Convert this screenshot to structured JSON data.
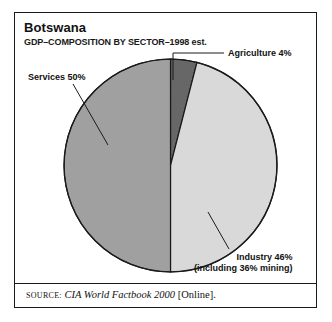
{
  "figure": {
    "title": "Botswana",
    "subtitle": "GDP–COMPOSITION BY SECTOR–1998 est.",
    "source_prefix": "SOURCE:",
    "source_italic": "CIA World Factbook 2000",
    "source_suffix": "[Online]."
  },
  "labels": {
    "services": "Services 50%",
    "agriculture": "Agriculture 4%",
    "industry_line1": "Industry 46%",
    "industry_line2": "(including 36% mining)"
  },
  "colors": {
    "outline": "#1a1a1a",
    "services": "#a0a0a0",
    "agriculture": "#676767",
    "industry": "#d9d9d9",
    "text": "#111111",
    "background": "#ffffff"
  },
  "chart_data": {
    "type": "pie",
    "title": "Botswana",
    "subtitle": "GDP–COMPOSITION BY SECTOR–1998 est.",
    "xlabel": "",
    "ylabel": "",
    "grid": false,
    "legend_position": "callout-labels",
    "start_angle_deg": 0,
    "direction": "clockwise",
    "units": "percent of GDP",
    "categories": [
      "Agriculture",
      "Industry",
      "Services"
    ],
    "values": [
      4,
      46,
      50
    ],
    "slices": [
      {
        "label": "Agriculture",
        "value": 4,
        "display": "Agriculture 4%",
        "color": "#676767"
      },
      {
        "label": "Industry",
        "value": 46,
        "display": "Industry 46%",
        "note": "(including 36% mining)",
        "color": "#d9d9d9"
      },
      {
        "label": "Services",
        "value": 50,
        "display": "Services 50%",
        "color": "#a0a0a0"
      }
    ],
    "annotations": [
      "(including 36% mining)"
    ],
    "source": "SOURCE: CIA World Factbook 2000 [Online]."
  }
}
